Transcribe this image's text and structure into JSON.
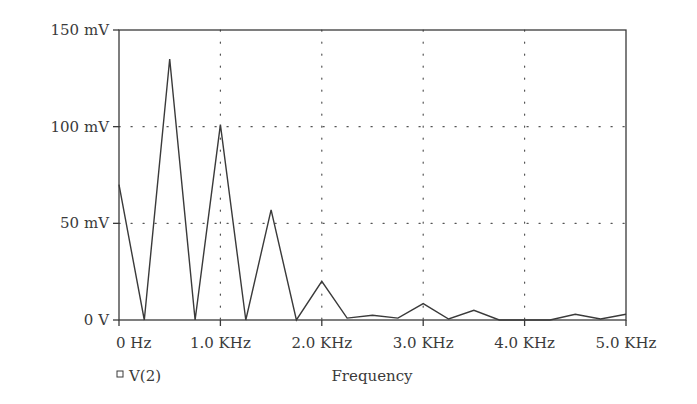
{
  "chart_data": {
    "type": "line",
    "title": "",
    "xlabel": "Frequency",
    "ylabel": "",
    "xlim": [
      0,
      5000
    ],
    "ylim": [
      0,
      150
    ],
    "x_unit": "Hz",
    "y_unit": "mV",
    "grid": true,
    "grid_style": "dotted",
    "legend_position": "bottom-left",
    "x_ticks": [
      0,
      1000,
      2000,
      3000,
      4000,
      5000
    ],
    "x_tick_labels": [
      "0 Hz",
      "1.0 KHz",
      "2.0 KHz",
      "3.0 KHz",
      "4.0 KHz",
      "5.0 KHz"
    ],
    "y_ticks": [
      0,
      50,
      100,
      150
    ],
    "y_tick_labels": [
      "0 V",
      "50 mV",
      "100 mV",
      "150 mV"
    ],
    "series": [
      {
        "name": "V(2)",
        "marker": "square",
        "x": [
          0,
          250,
          500,
          750,
          1000,
          1250,
          1500,
          1750,
          2000,
          2250,
          2500,
          2750,
          3000,
          3250,
          3500,
          3750,
          4000,
          4250,
          4500,
          4750,
          5000
        ],
        "values": [
          70,
          0,
          135,
          0,
          101,
          0,
          57,
          0,
          20,
          1,
          2.5,
          1,
          8.5,
          0.5,
          5,
          0,
          0,
          0,
          3,
          0.5,
          3
        ]
      }
    ]
  },
  "legend": {
    "marker_icon": "square-marker-icon",
    "label": "V(2)"
  },
  "axes": {
    "x_title": "Frequency"
  },
  "colors": {
    "line": "#3a3a3a",
    "axis": "#3a3a3a",
    "grid": "#555555",
    "background": "#ffffff"
  }
}
